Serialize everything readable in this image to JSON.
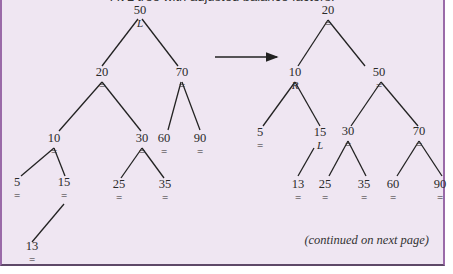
{
  "header": {
    "text": "AVL tree with adjusted balance factors:"
  },
  "footer": {
    "note": "(continued on next page)"
  },
  "colors": {
    "panel_bg": "#efe6f2",
    "border": "#9a6aa8",
    "ink": "#222222"
  },
  "arrow": {
    "x1": 213,
    "y1": 57,
    "x2": 275,
    "y2": 57,
    "label": "transforms-to"
  },
  "trees": [
    {
      "name": "before",
      "nodes": [
        {
          "id": "50",
          "value": "50",
          "bf": "L",
          "x": 138,
          "y": 14
        },
        {
          "id": "20",
          "value": "20",
          "bf": "=",
          "x": 100,
          "y": 76
        },
        {
          "id": "70",
          "value": "70",
          "bf": "=",
          "x": 180,
          "y": 76
        },
        {
          "id": "10",
          "value": "10",
          "bf": "=",
          "x": 52,
          "y": 142
        },
        {
          "id": "30",
          "value": "30",
          "bf": "=",
          "x": 140,
          "y": 142
        },
        {
          "id": "60",
          "value": "60",
          "bf": "=",
          "x": 162,
          "y": 142
        },
        {
          "id": "90",
          "value": "90",
          "bf": "=",
          "x": 198,
          "y": 142
        },
        {
          "id": "5",
          "value": "5",
          "bf": "=",
          "x": 15,
          "y": 186
        },
        {
          "id": "15",
          "value": "15",
          "bf": "=",
          "x": 62,
          "y": 186
        },
        {
          "id": "25",
          "value": "25",
          "bf": "=",
          "x": 117,
          "y": 188
        },
        {
          "id": "35",
          "value": "35",
          "bf": "=",
          "x": 163,
          "y": 188
        },
        {
          "id": "13",
          "value": "13",
          "bf": "=",
          "x": 30,
          "y": 250
        }
      ],
      "edges": [
        {
          "x1": 136,
          "y1": 19,
          "x2": 100,
          "y2": 66
        },
        {
          "x1": 140,
          "y1": 19,
          "x2": 176,
          "y2": 66
        },
        {
          "x1": 100,
          "y1": 82,
          "x2": 57,
          "y2": 131
        },
        {
          "x1": 100,
          "y1": 82,
          "x2": 139,
          "y2": 131
        },
        {
          "x1": 179,
          "y1": 82,
          "x2": 166,
          "y2": 130
        },
        {
          "x1": 180,
          "y1": 82,
          "x2": 198,
          "y2": 130
        },
        {
          "x1": 52,
          "y1": 148,
          "x2": 19,
          "y2": 176
        },
        {
          "x1": 52,
          "y1": 148,
          "x2": 63,
          "y2": 176
        },
        {
          "x1": 140,
          "y1": 148,
          "x2": 119,
          "y2": 178
        },
        {
          "x1": 140,
          "y1": 148,
          "x2": 162,
          "y2": 178
        },
        {
          "x1": 62,
          "y1": 204,
          "x2": 30,
          "y2": 242
        }
      ]
    },
    {
      "name": "after",
      "nodes": [
        {
          "id": "20",
          "value": "20",
          "bf": "=",
          "x": 326,
          "y": 14
        },
        {
          "id": "10",
          "value": "10",
          "bf": "R",
          "x": 293,
          "y": 76
        },
        {
          "id": "50",
          "value": "50",
          "bf": "=",
          "x": 377,
          "y": 76
        },
        {
          "id": "5",
          "value": "5",
          "bf": "=",
          "x": 258,
          "y": 136
        },
        {
          "id": "15",
          "value": "15",
          "bf": "L",
          "x": 318,
          "y": 136
        },
        {
          "id": "30",
          "value": "30",
          "bf": "=",
          "x": 346,
          "y": 135
        },
        {
          "id": "70",
          "value": "70",
          "bf": "=",
          "x": 417,
          "y": 135
        },
        {
          "id": "13",
          "value": "13",
          "bf": "=",
          "x": 296,
          "y": 188
        },
        {
          "id": "25",
          "value": "25",
          "bf": "=",
          "x": 323,
          "y": 188
        },
        {
          "id": "35",
          "value": "35",
          "bf": "=",
          "x": 362,
          "y": 188
        },
        {
          "id": "60",
          "value": "60",
          "bf": "=",
          "x": 391,
          "y": 188
        },
        {
          "id": "90",
          "value": "90",
          "bf": "=",
          "x": 438,
          "y": 188
        }
      ],
      "edges": [
        {
          "x1": 326,
          "y1": 20,
          "x2": 296,
          "y2": 66
        },
        {
          "x1": 326,
          "y1": 20,
          "x2": 363,
          "y2": 66
        },
        {
          "x1": 293,
          "y1": 82,
          "x2": 261,
          "y2": 126
        },
        {
          "x1": 293,
          "y1": 82,
          "x2": 318,
          "y2": 126
        },
        {
          "x1": 379,
          "y1": 82,
          "x2": 349,
          "y2": 126
        },
        {
          "x1": 379,
          "y1": 82,
          "x2": 416,
          "y2": 126
        },
        {
          "x1": 312,
          "y1": 148,
          "x2": 296,
          "y2": 176
        },
        {
          "x1": 346,
          "y1": 141,
          "x2": 327,
          "y2": 176
        },
        {
          "x1": 346,
          "y1": 141,
          "x2": 364,
          "y2": 176
        },
        {
          "x1": 417,
          "y1": 141,
          "x2": 395,
          "y2": 176
        },
        {
          "x1": 417,
          "y1": 141,
          "x2": 440,
          "y2": 176
        }
      ]
    }
  ]
}
